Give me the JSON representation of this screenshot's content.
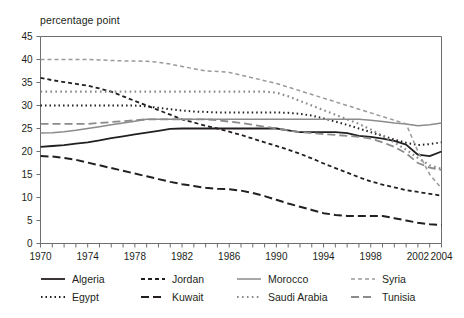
{
  "top_clipped_text": "",
  "axis_unit_label": "percentage point",
  "chart_data": {
    "type": "line",
    "title": "",
    "subtitle": "",
    "xlabel": "",
    "ylabel": "percentage point",
    "ylim": [
      0,
      45
    ],
    "xlim": [
      1970,
      2004
    ],
    "yticks": [
      0,
      5,
      10,
      15,
      20,
      25,
      30,
      35,
      40,
      45
    ],
    "xticks": [
      1970,
      1974,
      1978,
      1982,
      1986,
      1990,
      1994,
      1998,
      2002,
      2004
    ],
    "xtick_labels": [
      "1970",
      "1974",
      "1978",
      "1982",
      "1986",
      "1990",
      "1994",
      "1998",
      "2002",
      "2004"
    ],
    "ytick_labels": [
      "0",
      "5",
      "10",
      "15",
      "20",
      "25",
      "30",
      "35",
      "40",
      "45"
    ],
    "minor_xticks_every": 1,
    "grid": false,
    "legend_position": "bottom",
    "x": [
      1970,
      1971,
      1972,
      1973,
      1974,
      1975,
      1976,
      1977,
      1978,
      1979,
      1980,
      1981,
      1982,
      1983,
      1984,
      1985,
      1986,
      1987,
      1988,
      1989,
      1990,
      1991,
      1992,
      1993,
      1994,
      1995,
      1996,
      1997,
      1998,
      1999,
      2000,
      2001,
      2002,
      2003,
      2004
    ],
    "series": [
      {
        "name": "Algeria",
        "style": "solid",
        "color": "#231f20",
        "width": 1.8,
        "values": [
          21.0,
          21.2,
          21.4,
          21.7,
          22.0,
          22.4,
          22.9,
          23.3,
          23.7,
          24.1,
          24.5,
          24.9,
          25.0,
          25.0,
          25.0,
          25.0,
          25.0,
          25.0,
          25.0,
          25.0,
          25.0,
          24.6,
          24.2,
          24.2,
          24.2,
          24.2,
          24.0,
          23.4,
          23.2,
          22.8,
          22.3,
          21.5,
          19.3,
          19.0,
          20.0
        ]
      },
      {
        "name": "Egypt",
        "style": "dotted",
        "color": "#231f20",
        "width": 2.0,
        "values": [
          30.0,
          30.0,
          30.0,
          30.0,
          30.0,
          30.0,
          30.0,
          30.0,
          30.0,
          29.8,
          29.5,
          29.2,
          28.9,
          28.7,
          28.6,
          28.5,
          28.5,
          28.5,
          28.5,
          28.5,
          28.5,
          28.4,
          28.2,
          27.8,
          27.2,
          26.5,
          25.8,
          25.0,
          24.2,
          23.4,
          22.6,
          21.9,
          21.4,
          21.6,
          22.0
        ]
      },
      {
        "name": "Jordan",
        "style": "dashed-short",
        "color": "#231f20",
        "width": 1.8,
        "values": [
          36.0,
          35.5,
          35.1,
          34.7,
          34.3,
          33.7,
          33.0,
          32.0,
          31.0,
          30.0,
          29.0,
          28.0,
          27.0,
          26.3,
          25.6,
          25.0,
          24.3,
          23.6,
          22.8,
          22.0,
          21.2,
          20.4,
          19.5,
          18.5,
          17.4,
          16.4,
          15.4,
          14.4,
          13.5,
          12.8,
          12.2,
          11.6,
          11.2,
          10.8,
          10.4
        ]
      },
      {
        "name": "Kuwait",
        "style": "dashed-long",
        "color": "#231f20",
        "width": 2.0,
        "values": [
          19.0,
          18.9,
          18.6,
          18.2,
          17.6,
          17.0,
          16.4,
          15.8,
          15.2,
          14.6,
          14.0,
          13.4,
          12.9,
          12.5,
          12.1,
          11.9,
          11.8,
          11.5,
          11.0,
          10.3,
          9.5,
          8.7,
          8.0,
          7.3,
          6.6,
          6.2,
          6.0,
          6.0,
          6.0,
          6.0,
          5.5,
          5.0,
          4.5,
          4.2,
          4.0
        ]
      },
      {
        "name": "Morocco",
        "style": "solid",
        "color": "#8b8b8b",
        "width": 1.5,
        "values": [
          24.0,
          24.1,
          24.3,
          24.6,
          25.0,
          25.4,
          25.8,
          26.2,
          26.6,
          27.0,
          27.0,
          27.0,
          27.0,
          27.0,
          27.0,
          27.0,
          27.0,
          27.0,
          27.0,
          27.0,
          27.0,
          27.0,
          27.0,
          27.0,
          27.0,
          27.0,
          27.0,
          27.0,
          26.8,
          26.5,
          26.2,
          26.0,
          25.6,
          25.8,
          26.2
        ]
      },
      {
        "name": "Saudi Arabia",
        "style": "dotted",
        "color": "#8b8b8b",
        "width": 2.2,
        "values": [
          33.0,
          33.0,
          33.0,
          33.0,
          33.0,
          33.0,
          33.0,
          33.0,
          33.0,
          33.0,
          33.0,
          33.0,
          33.0,
          33.0,
          33.0,
          33.0,
          33.0,
          33.0,
          33.0,
          33.0,
          32.8,
          32.0,
          31.0,
          30.0,
          29.0,
          28.0,
          27.0,
          26.0,
          24.8,
          23.4,
          22.0,
          20.4,
          18.6,
          17.0,
          16.2
        ]
      },
      {
        "name": "Syria",
        "style": "dashed-short",
        "color": "#9a9a9a",
        "width": 1.5,
        "values": [
          40.0,
          40.0,
          40.0,
          40.0,
          40.0,
          39.9,
          39.8,
          39.7,
          39.7,
          39.6,
          39.4,
          39.0,
          38.5,
          38.0,
          37.5,
          37.4,
          37.2,
          36.6,
          36.0,
          35.4,
          34.8,
          34.0,
          33.2,
          32.4,
          31.6,
          30.8,
          30.0,
          29.2,
          28.4,
          27.6,
          26.8,
          26.0,
          20.0,
          15.0,
          12.0
        ]
      },
      {
        "name": "Tunisia",
        "style": "dashed-long",
        "color": "#8b8b8b",
        "width": 1.8,
        "values": [
          26.0,
          26.0,
          26.0,
          26.0,
          26.0,
          26.2,
          26.4,
          26.6,
          26.8,
          27.0,
          27.0,
          27.0,
          27.0,
          27.0,
          27.0,
          26.8,
          26.5,
          26.2,
          25.8,
          25.4,
          25.0,
          24.6,
          24.2,
          24.0,
          23.8,
          23.6,
          23.4,
          23.2,
          22.8,
          22.0,
          21.0,
          19.6,
          17.5,
          16.5,
          16.0
        ]
      }
    ]
  },
  "legend": {
    "rows": [
      [
        {
          "label": "Algeria",
          "series": "Algeria"
        },
        {
          "label": "Jordan",
          "series": "Jordan"
        },
        {
          "label": "Morocco",
          "series": "Morocco"
        },
        {
          "label": "Syria",
          "series": "Syria"
        }
      ],
      [
        {
          "label": "Egypt",
          "series": "Egypt"
        },
        {
          "label": "Kuwait",
          "series": "Kuwait"
        },
        {
          "label": "Saudi Arabia",
          "series": "Saudi Arabia"
        },
        {
          "label": "Tunisia",
          "series": "Tunisia"
        }
      ]
    ]
  },
  "colors": {
    "axis": "#6d6e71",
    "dark_ink": "#231f20",
    "grey_ink": "#8b8b8b",
    "background": "#ffffff"
  }
}
